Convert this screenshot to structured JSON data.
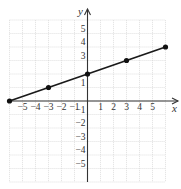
{
  "chart_data": {
    "type": "line",
    "title": "",
    "xlabel": "x",
    "ylabel": "y",
    "xlim": [
      -6,
      6
    ],
    "ylim": [
      -6,
      6
    ],
    "grid": true,
    "legend": null,
    "x_ticks": [
      -5,
      -4,
      -3,
      -2,
      -1,
      1,
      2,
      3,
      4,
      5
    ],
    "y_ticks": [
      5,
      4,
      3,
      1,
      -1,
      -2,
      -3,
      -4,
      -5
    ],
    "x_tick_labels": [
      "−5",
      "−4",
      "−3",
      "−2",
      "−1",
      "1",
      "2",
      "3",
      "4",
      "5"
    ],
    "y_tick_labels": [
      "5",
      "4",
      "3",
      "1",
      "−1",
      "−2",
      "−3",
      "−4",
      "−5"
    ],
    "series": [
      {
        "name": "line",
        "x": [
          -6,
          -3,
          0,
          3,
          6
        ],
        "y": [
          0,
          1,
          2,
          3,
          4
        ],
        "marked_points": true
      }
    ]
  },
  "layout": {
    "origin_px": [
      87.5,
      101
    ],
    "unit_x_px": 13.0,
    "unit_y_px": 13.5
  }
}
